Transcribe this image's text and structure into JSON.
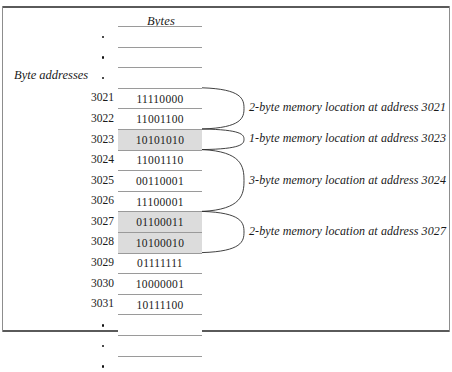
{
  "figure": {
    "column_header": "Bytes",
    "row_label": "Byte addresses"
  },
  "table": {
    "ellipsis_glyph": "•",
    "top_ellipsis_rows": 3,
    "bottom_ellipsis_rows": 3,
    "rows": [
      {
        "address": "3021",
        "value": "11110000",
        "shaded": false
      },
      {
        "address": "3022",
        "value": "11001100",
        "shaded": false
      },
      {
        "address": "3023",
        "value": "10101010",
        "shaded": true
      },
      {
        "address": "3024",
        "value": "11001110",
        "shaded": false
      },
      {
        "address": "3025",
        "value": "00110001",
        "shaded": false
      },
      {
        "address": "3026",
        "value": "11100001",
        "shaded": false
      },
      {
        "address": "3027",
        "value": "01100011",
        "shaded": true
      },
      {
        "address": "3028",
        "value": "10100010",
        "shaded": true
      },
      {
        "address": "3029",
        "value": "01111111",
        "shaded": false
      },
      {
        "address": "3030",
        "value": "10000001",
        "shaded": false
      },
      {
        "address": "3031",
        "value": "10111100",
        "shaded": false
      }
    ]
  },
  "annotations": [
    {
      "text": "2-byte memory location at address 3021",
      "size_bytes": 2,
      "start_address": "3021"
    },
    {
      "text": "1-byte memory location at address 3023",
      "size_bytes": 1,
      "start_address": "3023"
    },
    {
      "text": "3-byte memory location at address 3024",
      "size_bytes": 3,
      "start_address": "3024"
    },
    {
      "text": "2-byte memory location at address 3027",
      "size_bytes": 2,
      "start_address": "3027"
    }
  ],
  "colors": {
    "shaded_cell": "#dcdcdc",
    "rule": "#8a8a8a",
    "frame": "#5a5a5a",
    "text": "#1a1a1a"
  }
}
